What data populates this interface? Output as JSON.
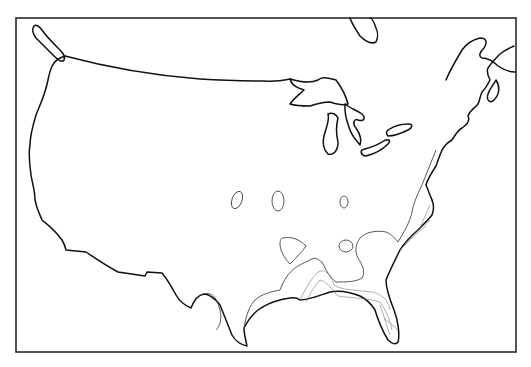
{
  "map": {
    "subject": "Contiguous United States outline map with contour lines",
    "region": "United States",
    "colors": {
      "background": "#ffffff",
      "outline": "#111111",
      "contour": "#444444",
      "frame": "#2a2a2a"
    },
    "features": [
      "coastline",
      "great-lakes",
      "canada-border",
      "contour-isolines",
      "isolated-contour-islands"
    ]
  }
}
